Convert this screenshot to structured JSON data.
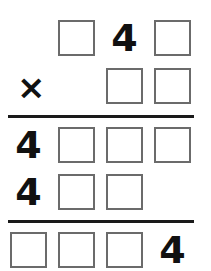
{
  "puzzle": {
    "type": "multiplication-cryptarithm",
    "operator": "×",
    "rows": {
      "multiplicand": [
        "box",
        "4",
        "box"
      ],
      "multiplier": [
        "box",
        "box"
      ],
      "partial_product_1": [
        "4",
        "box",
        "box",
        "box"
      ],
      "partial_product_2": [
        "4",
        "box",
        "box"
      ],
      "result": [
        "box",
        "box",
        "box",
        "4"
      ]
    },
    "digits": {
      "multiplicand_middle": "4",
      "partial1_first": "4",
      "partial2_first": "4",
      "result_last": "4"
    },
    "colors": {
      "box_border": "#6b6b6b",
      "text": "#111111",
      "rule": "#1a1a1a"
    }
  }
}
